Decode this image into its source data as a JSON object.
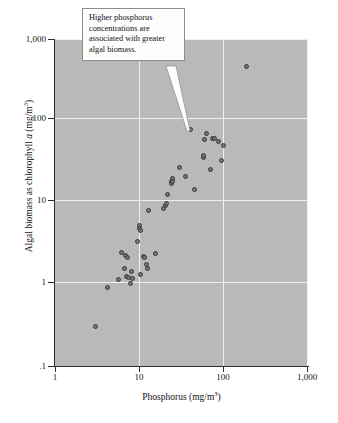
{
  "figure": {
    "background_color": "#ffffff",
    "panel_color": "#b9b9b9",
    "grid_color": "#efefef",
    "marker_color": "#757575",
    "marker_edge_color": "#3a3a3a",
    "axis_color": "#2e2e2e"
  },
  "annotation": {
    "text": "Higher phosphorus concentrations are associated with greater algal biomass.",
    "lines": [
      "Higher phosphorus",
      "concentrations are",
      "associated with greater",
      "algal biomass."
    ],
    "target_point": {
      "x": 40,
      "y": 78
    }
  },
  "axes": {
    "x": {
      "title_prefix": "Phosphorus (mg/m",
      "title_sup": "3",
      "title_suffix": ")",
      "ticks": [
        "1",
        "10",
        "100",
        "1,000"
      ],
      "tick_values": [
        1,
        10,
        100,
        1000
      ],
      "scale": "log",
      "range": [
        1,
        1000
      ]
    },
    "y": {
      "title_prefix": "Algal biomass as chlorophyll ",
      "title_italic": "a",
      "title_mid": " (mg/m",
      "title_sup": "3",
      "title_suffix": ")",
      "ticks": [
        ".1",
        "1",
        "10",
        "100",
        "1,000"
      ],
      "tick_values": [
        0.1,
        1,
        10,
        100,
        1000
      ],
      "scale": "log",
      "range": [
        0.1,
        1000
      ]
    }
  },
  "chart_data": {
    "type": "scatter",
    "title": "",
    "xlabel": "Phosphorus (mg/m3)",
    "ylabel": "Algal biomass as chlorophyll a (mg/m3)",
    "xscale": "log",
    "yscale": "log",
    "xlim": [
      1,
      1000
    ],
    "ylim": [
      0.1,
      1000
    ],
    "grid": true,
    "legend": null,
    "annotations": [
      {
        "text": "Higher phosphorus concentrations are associated with greater algal biomass.",
        "points_to": [
          40,
          78
        ]
      }
    ],
    "points": [
      [
        3.0,
        0.3
      ],
      [
        4.2,
        0.9
      ],
      [
        5.6,
        1.15
      ],
      [
        6.2,
        2.45
      ],
      [
        6.6,
        1.55
      ],
      [
        6.9,
        2.25
      ],
      [
        7.0,
        1.25
      ],
      [
        7.3,
        2.15
      ],
      [
        7.4,
        1.2
      ],
      [
        7.8,
        1.02
      ],
      [
        8.0,
        1.45
      ],
      [
        8.4,
        1.18
      ],
      [
        9.6,
        3.3
      ],
      [
        10.0,
        5.2
      ],
      [
        10.1,
        4.8
      ],
      [
        10.2,
        4.6
      ],
      [
        10.4,
        1.3
      ],
      [
        11.2,
        2.2
      ],
      [
        11.5,
        2.1
      ],
      [
        12.0,
        1.75
      ],
      [
        12.6,
        1.55
      ],
      [
        13.0,
        8.0
      ],
      [
        15.5,
        2.35
      ],
      [
        19.5,
        8.4
      ],
      [
        20.5,
        9.3
      ],
      [
        21.0,
        9.6
      ],
      [
        21.5,
        12.5
      ],
      [
        24.0,
        18.0
      ],
      [
        24.3,
        17.0
      ],
      [
        24.8,
        19.5
      ],
      [
        25.0,
        18.2
      ],
      [
        30.0,
        27.0
      ],
      [
        35.0,
        21.0
      ],
      [
        40.0,
        78.0
      ],
      [
        45.0,
        14.5
      ],
      [
        57.0,
        36.0
      ],
      [
        58.0,
        38.0
      ],
      [
        60.0,
        59.0
      ],
      [
        62.0,
        70.0
      ],
      [
        70.0,
        25.0
      ],
      [
        74.0,
        61.0
      ],
      [
        78.0,
        60.0
      ],
      [
        88.0,
        56.0
      ],
      [
        95.0,
        33.0
      ],
      [
        100.0,
        50.0
      ],
      [
        185.0,
        460.0
      ]
    ]
  }
}
